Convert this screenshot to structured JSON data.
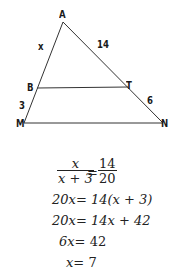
{
  "diagram": {
    "vertices": {
      "A": {
        "label": "A",
        "x": 63,
        "y": 22
      },
      "B": {
        "label": "B",
        "x": 37,
        "y": 88
      },
      "T": {
        "label": "T",
        "x": 128,
        "y": 87
      },
      "M": {
        "label": "M",
        "x": 24,
        "y": 123
      },
      "N": {
        "label": "N",
        "x": 163,
        "y": 123
      }
    },
    "segment_labels": {
      "AB": "x",
      "AT": "14",
      "BM": "3",
      "TN": "6"
    },
    "line_color": "#333333"
  },
  "solution": {
    "fraction_left": {
      "num": "x",
      "den": "x + 3"
    },
    "equals": "=",
    "fraction_right": {
      "num": "14",
      "den": "20"
    },
    "steps": [
      {
        "lhs": "20x",
        "rhs": "14(x + 3)"
      },
      {
        "lhs": "20x",
        "rhs": "14x + 42"
      },
      {
        "lhs": "6x",
        "rhs": "42"
      },
      {
        "lhs": "x",
        "rhs": "7"
      }
    ]
  }
}
